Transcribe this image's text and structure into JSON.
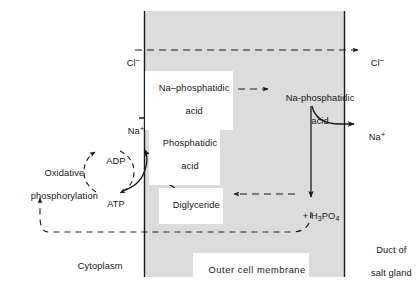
{
  "diagram": {
    "regions": {
      "cytoplasm_label": "Cytoplasm",
      "membrane_label": "Outer cell membrane",
      "duct_line1": "Duct of",
      "duct_line2": "salt gland"
    },
    "nodes": {
      "chloride_in": "Cl",
      "chloride_in_charge": "−",
      "chloride_out": "Cl",
      "chloride_out_charge": "−",
      "sodium_in": "Na",
      "sodium_in_charge": "+",
      "sodium_out": "Na",
      "sodium_out_charge": "+",
      "na_phosphatidic_inner_line1": "Na–phosphatidic",
      "na_phosphatidic_inner_line2": "acid",
      "na_phosphatidic_outer_line1": "Na-phosphatidic",
      "na_phosphatidic_outer_line2": "acid",
      "phosphatidic_line1": "Phosphatidic",
      "phosphatidic_line2": "acid",
      "diglyceride": "Diglyceride",
      "adp": "ADP",
      "atp": "ATP",
      "oxidative_line1": "Oxidative",
      "oxidative_line2": "phosphorylation",
      "phosphate_plus": "+ H",
      "phosphate_sub1": "3",
      "phosphate_mid": "PO",
      "phosphate_sub2": "4"
    },
    "colors": {
      "membrane_fill": "#dcdcdc",
      "stroke": "#1a1a1a",
      "background": "#ffffff",
      "text": "#161616"
    }
  }
}
